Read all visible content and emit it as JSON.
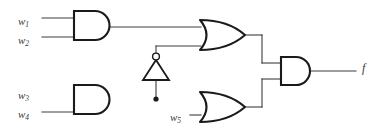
{
  "diagram": {
    "background_color": "#ffffff",
    "wire_color": "#3c3c3c",
    "gate_outline_color": "#1a1a1a",
    "label_color": "#3a3a3a"
  },
  "labels": {
    "w1": {
      "name": "w",
      "sub": "1"
    },
    "w2": {
      "name": "w",
      "sub": "2"
    },
    "w3": {
      "name": "w",
      "sub": "3"
    },
    "w4": {
      "name": "w",
      "sub": "4"
    },
    "w5": {
      "name": "w",
      "sub": "5"
    },
    "f": {
      "name": "f"
    }
  },
  "gates": [
    {
      "id": "and-top",
      "type": "AND",
      "inputs": [
        "w1",
        "w2"
      ],
      "output": "a"
    },
    {
      "id": "and-bottom",
      "type": "AND",
      "inputs": [
        "w3",
        "w4"
      ],
      "output": "b"
    },
    {
      "id": "not-mid",
      "type": "NOT",
      "inputs": [
        "b"
      ],
      "output": "nb"
    },
    {
      "id": "or-top",
      "type": "OR",
      "inputs": [
        "a",
        "nb"
      ],
      "output": "c"
    },
    {
      "id": "or-bottom",
      "type": "OR",
      "inputs": [
        "b",
        "w5"
      ],
      "output": "d"
    },
    {
      "id": "and-out",
      "type": "AND",
      "inputs": [
        "c",
        "d"
      ],
      "output": "f"
    }
  ],
  "nodes": [
    {
      "id": "junction-b",
      "type": "junction",
      "x": 156,
      "y": 99
    }
  ],
  "tinted_wires": [
    {
      "id": "wire-w3",
      "colors": [
        "#8f86c4",
        "#6f6f9a",
        "#4a4a4a"
      ]
    },
    {
      "id": "wire-and2",
      "colors": [
        "#3fc8e8",
        "#4fb98a",
        "#7a6a52",
        "#8a6a48"
      ]
    }
  ],
  "expression": "f = (w1 · w2 + (w3 · w4)') · (w3 · w4 + w5)"
}
